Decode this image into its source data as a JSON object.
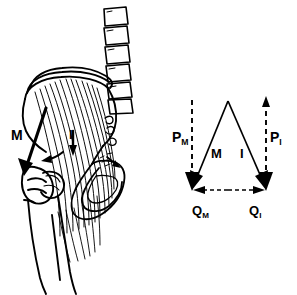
{
  "figure": {
    "background_color": "#ffffff",
    "ink_color": "#000000",
    "width": 297,
    "height": 295
  },
  "anatomy_panel": {
    "name": "Lateral view of pelvis, lumbar vertebrae and proximal femur with gluteal musculature",
    "vertebrae_count": 6,
    "labels": [
      {
        "id": "anat-m",
        "text": "M",
        "sub": "",
        "meaning": "muscle force vector on pelvis"
      },
      {
        "id": "anat-i",
        "text": "I",
        "sub": "",
        "meaning": "iliac / joint force direction marker"
      }
    ]
  },
  "force_diagram": {
    "name": "Force vector triangle",
    "type": "vector-diagram",
    "apex": {
      "x": 228,
      "y": 101
    },
    "left_corner": {
      "x": 192,
      "y": 190
    },
    "right_corner": {
      "x": 266,
      "y": 190
    },
    "vectors": [
      {
        "id": "P_M",
        "label": "P",
        "subscript": "M",
        "style": "dashed",
        "orientation": "vertical",
        "arrow": "down",
        "x": 192,
        "y_top": 100,
        "y_bottom": 190
      },
      {
        "id": "P_I",
        "label": "P",
        "subscript": "I",
        "style": "dashed",
        "orientation": "vertical",
        "arrow": "both",
        "x": 266,
        "y_top": 100,
        "y_bottom": 190
      },
      {
        "id": "M",
        "label": "M",
        "subscript": "",
        "style": "solid",
        "orientation": "diagonal",
        "arrow": "down-left",
        "from": {
          "x": 228,
          "y": 101
        },
        "to": {
          "x": 192,
          "y": 190
        }
      },
      {
        "id": "I",
        "label": "I",
        "subscript": "",
        "style": "solid",
        "orientation": "diagonal",
        "arrow": "down-right",
        "from": {
          "x": 228,
          "y": 101
        },
        "to": {
          "x": 266,
          "y": 190
        }
      },
      {
        "id": "Q_M",
        "label": "Q",
        "subscript": "M",
        "style": "dashed",
        "orientation": "horizontal",
        "arrow": "left",
        "y": 190,
        "x_from": 228,
        "x_to": 192
      },
      {
        "id": "Q_I",
        "label": "Q",
        "subscript": "I",
        "style": "dashed",
        "orientation": "horizontal",
        "arrow": "right",
        "y": 190,
        "x_from": 228,
        "x_to": 266
      }
    ]
  }
}
